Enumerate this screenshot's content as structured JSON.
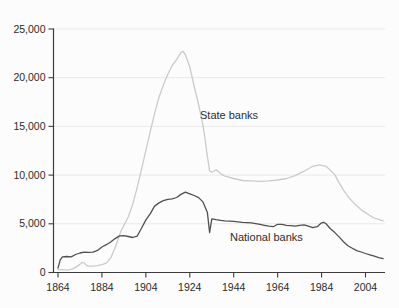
{
  "figure": {
    "description_visible_text_only": "",
    "background_color": "#fcfcfc"
  },
  "chart_data": {
    "type": "line",
    "grid": "horizontal",
    "legend_position": "inline-annotations",
    "x_axis": {
      "min": 1864,
      "max": 2013,
      "ticks": [
        {
          "year": 1864,
          "label": "1864"
        },
        {
          "year": 1884,
          "label": "1884"
        },
        {
          "year": 1904,
          "label": "1904"
        },
        {
          "year": 1924,
          "label": "1924"
        },
        {
          "year": 1944,
          "label": "1944"
        },
        {
          "year": 1964,
          "label": "1964"
        },
        {
          "year": 1984,
          "label": "1984"
        },
        {
          "year": 2004,
          "label": "2004"
        }
      ]
    },
    "y_axis": {
      "min": 0,
      "max": 25000,
      "ticks": [
        {
          "value": 0,
          "label": "0"
        },
        {
          "value": 5000,
          "label": "5,000"
        },
        {
          "value": 10000,
          "label": "10,000"
        },
        {
          "value": 15000,
          "label": "15,000"
        },
        {
          "value": 20000,
          "label": "20,000"
        },
        {
          "value": 25000,
          "label": "25,000"
        }
      ]
    },
    "series": [
      {
        "name": "State banks",
        "label_text": "State banks",
        "color": "#cbcbcb",
        "points": [
          [
            1864,
            300
          ],
          [
            1866,
            290
          ],
          [
            1868,
            250
          ],
          [
            1870,
            320
          ],
          [
            1872,
            520
          ],
          [
            1874,
            830
          ],
          [
            1875,
            1050
          ],
          [
            1876,
            950
          ],
          [
            1877,
            720
          ],
          [
            1878,
            660
          ],
          [
            1880,
            660
          ],
          [
            1882,
            700
          ],
          [
            1884,
            810
          ],
          [
            1886,
            950
          ],
          [
            1888,
            1500
          ],
          [
            1890,
            2550
          ],
          [
            1892,
            3850
          ],
          [
            1893,
            4400
          ],
          [
            1894,
            4850
          ],
          [
            1896,
            5700
          ],
          [
            1898,
            7000
          ],
          [
            1900,
            8700
          ],
          [
            1902,
            10600
          ],
          [
            1904,
            12550
          ],
          [
            1906,
            14500
          ],
          [
            1908,
            16300
          ],
          [
            1910,
            18000
          ],
          [
            1912,
            19250
          ],
          [
            1914,
            20350
          ],
          [
            1916,
            21250
          ],
          [
            1918,
            21850
          ],
          [
            1920,
            22600
          ],
          [
            1921,
            22700
          ],
          [
            1922,
            22350
          ],
          [
            1924,
            21100
          ],
          [
            1926,
            19100
          ],
          [
            1928,
            17250
          ],
          [
            1930,
            15100
          ],
          [
            1931,
            13600
          ],
          [
            1932,
            11900
          ],
          [
            1933,
            10450
          ],
          [
            1934,
            10300
          ],
          [
            1936,
            10550
          ],
          [
            1938,
            10150
          ],
          [
            1940,
            9900
          ],
          [
            1944,
            9650
          ],
          [
            1948,
            9450
          ],
          [
            1952,
            9400
          ],
          [
            1956,
            9350
          ],
          [
            1960,
            9400
          ],
          [
            1964,
            9500
          ],
          [
            1968,
            9650
          ],
          [
            1972,
            9950
          ],
          [
            1976,
            10400
          ],
          [
            1980,
            10900
          ],
          [
            1983,
            11050
          ],
          [
            1986,
            10900
          ],
          [
            1988,
            10500
          ],
          [
            1990,
            10050
          ],
          [
            1992,
            9200
          ],
          [
            1994,
            8450
          ],
          [
            1996,
            7800
          ],
          [
            1998,
            7300
          ],
          [
            2000,
            6850
          ],
          [
            2002,
            6450
          ],
          [
            2004,
            6150
          ],
          [
            2006,
            5850
          ],
          [
            2008,
            5600
          ],
          [
            2010,
            5450
          ],
          [
            2012,
            5300
          ]
        ]
      },
      {
        "name": "National banks",
        "label_text": "National banks",
        "color": "#505050",
        "points": [
          [
            1864,
            450
          ],
          [
            1865,
            1300
          ],
          [
            1866,
            1600
          ],
          [
            1868,
            1640
          ],
          [
            1870,
            1610
          ],
          [
            1872,
            1850
          ],
          [
            1874,
            2000
          ],
          [
            1876,
            2090
          ],
          [
            1878,
            2060
          ],
          [
            1880,
            2090
          ],
          [
            1882,
            2270
          ],
          [
            1884,
            2620
          ],
          [
            1886,
            2850
          ],
          [
            1888,
            3130
          ],
          [
            1890,
            3480
          ],
          [
            1892,
            3760
          ],
          [
            1894,
            3790
          ],
          [
            1896,
            3700
          ],
          [
            1898,
            3590
          ],
          [
            1900,
            3730
          ],
          [
            1902,
            4540
          ],
          [
            1904,
            5400
          ],
          [
            1906,
            6050
          ],
          [
            1908,
            6820
          ],
          [
            1910,
            7150
          ],
          [
            1912,
            7370
          ],
          [
            1914,
            7520
          ],
          [
            1916,
            7570
          ],
          [
            1918,
            7700
          ],
          [
            1920,
            8020
          ],
          [
            1922,
            8250
          ],
          [
            1924,
            8080
          ],
          [
            1926,
            7910
          ],
          [
            1928,
            7690
          ],
          [
            1930,
            7250
          ],
          [
            1932,
            6150
          ],
          [
            1933,
            4100
          ],
          [
            1934,
            5500
          ],
          [
            1936,
            5420
          ],
          [
            1938,
            5350
          ],
          [
            1940,
            5300
          ],
          [
            1944,
            5250
          ],
          [
            1948,
            5150
          ],
          [
            1952,
            5100
          ],
          [
            1956,
            4950
          ],
          [
            1958,
            4850
          ],
          [
            1960,
            4750
          ],
          [
            1962,
            4700
          ],
          [
            1964,
            4950
          ],
          [
            1966,
            4950
          ],
          [
            1968,
            4850
          ],
          [
            1970,
            4800
          ],
          [
            1972,
            4750
          ],
          [
            1974,
            4850
          ],
          [
            1976,
            4900
          ],
          [
            1978,
            4750
          ],
          [
            1980,
            4600
          ],
          [
            1982,
            4700
          ],
          [
            1984,
            5100
          ],
          [
            1985,
            5150
          ],
          [
            1986,
            5000
          ],
          [
            1988,
            4500
          ],
          [
            1990,
            4100
          ],
          [
            1992,
            3650
          ],
          [
            1994,
            3150
          ],
          [
            1996,
            2750
          ],
          [
            1998,
            2500
          ],
          [
            2000,
            2250
          ],
          [
            2002,
            2100
          ],
          [
            2004,
            1950
          ],
          [
            2006,
            1820
          ],
          [
            2008,
            1680
          ],
          [
            2010,
            1530
          ],
          [
            2012,
            1420
          ]
        ]
      }
    ]
  }
}
